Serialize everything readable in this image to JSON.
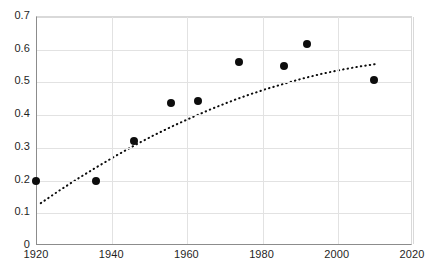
{
  "chart_data": {
    "type": "scatter",
    "title": "",
    "subtitle": "",
    "xlabel": "",
    "ylabel": "",
    "xlim": [
      1920,
      2020
    ],
    "ylim": [
      0,
      0.7
    ],
    "grid": true,
    "legend": null,
    "legend_position": "none",
    "xticks": [
      "1920",
      "1940",
      "1960",
      "1980",
      "2000",
      "2020"
    ],
    "xtick_values": [
      1920,
      1940,
      1960,
      1980,
      2000,
      2020
    ],
    "yticks": [
      "0",
      "0.1",
      "0.2",
      "0.3",
      "0.4",
      "0.5",
      "0.6",
      "0.7"
    ],
    "ytick_values": [
      0,
      0.1,
      0.2,
      0.3,
      0.4,
      0.5,
      0.6,
      0.7
    ],
    "marker_color": "#0d0d0d",
    "marker_style": "filled-circle",
    "gridline_color": "#e2e2e2",
    "axis_color": "#8c8c8c",
    "series": [
      {
        "name": "observations",
        "type": "scatter",
        "x": [
          1920,
          1936,
          1946,
          1956,
          1963,
          1974,
          1986,
          1992,
          2010
        ],
        "y": [
          0.197,
          0.196,
          0.317,
          0.433,
          0.441,
          0.56,
          0.548,
          0.615,
          0.505
        ]
      },
      {
        "name": "trend",
        "type": "line",
        "line_style": "dotted",
        "color": "#0d0d0d",
        "x": [
          1921,
          1926,
          1931,
          1936,
          1941,
          1946,
          1951,
          1956,
          1961,
          1966,
          1971,
          1976,
          1981,
          1986,
          1991,
          1996,
          2001,
          2006,
          2010
        ],
        "y": [
          0.131,
          0.17,
          0.207,
          0.242,
          0.276,
          0.308,
          0.338,
          0.366,
          0.392,
          0.417,
          0.44,
          0.461,
          0.48,
          0.497,
          0.513,
          0.527,
          0.539,
          0.549,
          0.556
        ]
      }
    ]
  },
  "watermark": {
    "text": ""
  }
}
